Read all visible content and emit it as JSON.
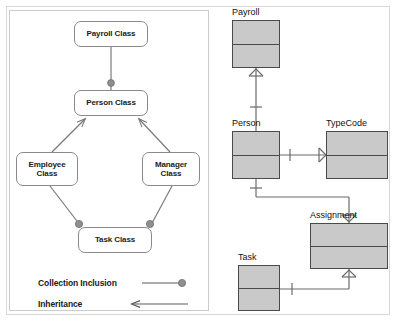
{
  "diagram": {
    "title_visible": false,
    "colors": {
      "uml_box_fill": "#ffffff",
      "uml_box_stroke": "#8a8a8a",
      "er_box_fill": "#c9c9c9",
      "er_box_stroke": "#4a4a4a",
      "connector": "#7a7a7a",
      "er_connector": "#6b6b6b",
      "panel_border": "#cccccc",
      "outer_border": "#d8d8d8",
      "text": "#1a1a1a"
    }
  },
  "class_diagram": {
    "name": "uml-class-diagram",
    "nodes": [
      {
        "id": "payroll",
        "label": "Payroll Class",
        "x": 74,
        "y": 21,
        "w": 74,
        "h": 26
      },
      {
        "id": "person",
        "label": "Person Class",
        "x": 74,
        "y": 90,
        "w": 74,
        "h": 26
      },
      {
        "id": "employee",
        "label": "Employee\nClass",
        "line1": "Employee",
        "line2": "Class",
        "x": 16,
        "y": 152,
        "w": 62,
        "h": 34
      },
      {
        "id": "manager",
        "label": "Manager\nClass",
        "line1": "Manager",
        "line2": "Class",
        "x": 142,
        "y": 152,
        "w": 58,
        "h": 34
      },
      {
        "id": "task",
        "label": "Task Class",
        "x": 78,
        "y": 227,
        "w": 74,
        "h": 26
      }
    ],
    "edges": [
      {
        "from": "payroll",
        "to": "person",
        "type": "collection-inclusion",
        "marker": "filled-circle"
      },
      {
        "from": "employee",
        "to": "person",
        "type": "inheritance",
        "marker": "open-arrow"
      },
      {
        "from": "manager",
        "to": "person",
        "type": "inheritance",
        "marker": "open-arrow"
      },
      {
        "from": "employee",
        "to": "task",
        "type": "collection-inclusion",
        "marker": "filled-circle"
      },
      {
        "from": "manager",
        "to": "task",
        "type": "collection-inclusion",
        "marker": "filled-circle"
      }
    ]
  },
  "legend": {
    "name": "legend",
    "items": [
      {
        "label": "Collection Inclusion",
        "symbol": "line-with-filled-circle"
      },
      {
        "label": "Inheritance",
        "symbol": "left-arrow"
      }
    ]
  },
  "er_diagram": {
    "name": "entity-relationship-diagram",
    "entities": [
      {
        "id": "payroll",
        "label": "Payroll",
        "x": 232,
        "y": 20,
        "w": 48,
        "h": 48,
        "divider_y": 24
      },
      {
        "id": "person",
        "label": "Person",
        "x": 232,
        "y": 131,
        "w": 48,
        "h": 48,
        "divider_y": 24
      },
      {
        "id": "typecode",
        "label": "TypeCode",
        "x": 326,
        "y": 131,
        "w": 62,
        "h": 48,
        "divider_y": 24
      },
      {
        "id": "assignment",
        "label": "Assignment",
        "x": 310,
        "y": 223,
        "w": 78,
        "h": 46,
        "divider_y": 23
      },
      {
        "id": "task",
        "label": "Task",
        "x": 238,
        "y": 265,
        "w": 42,
        "h": 46,
        "divider_y": 23
      }
    ],
    "relationships": [
      {
        "from": "person",
        "to": "payroll",
        "from_cardinality": "one",
        "to_cardinality": "many"
      },
      {
        "from": "person",
        "to": "typecode",
        "from_cardinality": "one",
        "to_cardinality": "many"
      },
      {
        "from": "person",
        "to": "assignment",
        "from_cardinality": "one",
        "to_cardinality": "many"
      },
      {
        "from": "task",
        "to": "assignment",
        "from_cardinality": "one",
        "to_cardinality": "many"
      }
    ],
    "notation": "crow's foot"
  }
}
